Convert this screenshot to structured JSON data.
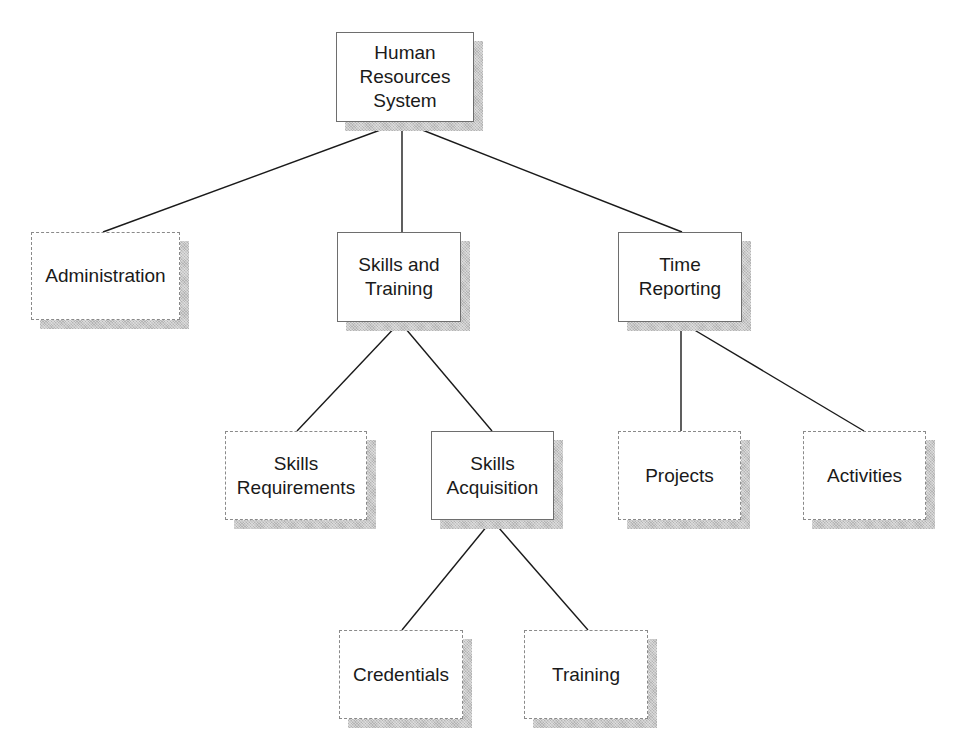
{
  "diagram": {
    "type": "hierarchy-chart",
    "legend_note": "solid boxes = expanded subsystems; dashed boxes = leaf modules",
    "colors": {
      "background": "#ffffff",
      "line": "#1a1a1a",
      "solid_border": "#6e6e6e",
      "dashed_border": "#8a8a8a",
      "shadow": "#c8c8c8",
      "text": "#1a1a1a"
    },
    "nodes": {
      "root": {
        "label": "Human\nResources\nSystem",
        "style": "solid"
      },
      "administration": {
        "label": "Administration",
        "style": "dashed"
      },
      "skills_training": {
        "label": "Skills and\nTraining",
        "style": "solid"
      },
      "time_reporting": {
        "label": "Time\nReporting",
        "style": "solid"
      },
      "skills_requirements": {
        "label": "Skills\nRequirements",
        "style": "dashed"
      },
      "skills_acquisition": {
        "label": "Skills\nAcquisition",
        "style": "solid"
      },
      "projects": {
        "label": "Projects",
        "style": "dashed"
      },
      "activities": {
        "label": "Activities",
        "style": "dashed"
      },
      "credentials": {
        "label": "Credentials",
        "style": "dashed"
      },
      "training": {
        "label": "Training",
        "style": "dashed"
      }
    },
    "edges": [
      {
        "from": "Human Resources System",
        "to": "Administration"
      },
      {
        "from": "Human Resources System",
        "to": "Skills and Training"
      },
      {
        "from": "Human Resources System",
        "to": "Time Reporting"
      },
      {
        "from": "Skills and Training",
        "to": "Skills Requirements"
      },
      {
        "from": "Skills and Training",
        "to": "Skills Acquisition"
      },
      {
        "from": "Time Reporting",
        "to": "Projects"
      },
      {
        "from": "Time Reporting",
        "to": "Activities"
      },
      {
        "from": "Skills Acquisition",
        "to": "Credentials"
      },
      {
        "from": "Skills Acquisition",
        "to": "Training"
      }
    ]
  }
}
